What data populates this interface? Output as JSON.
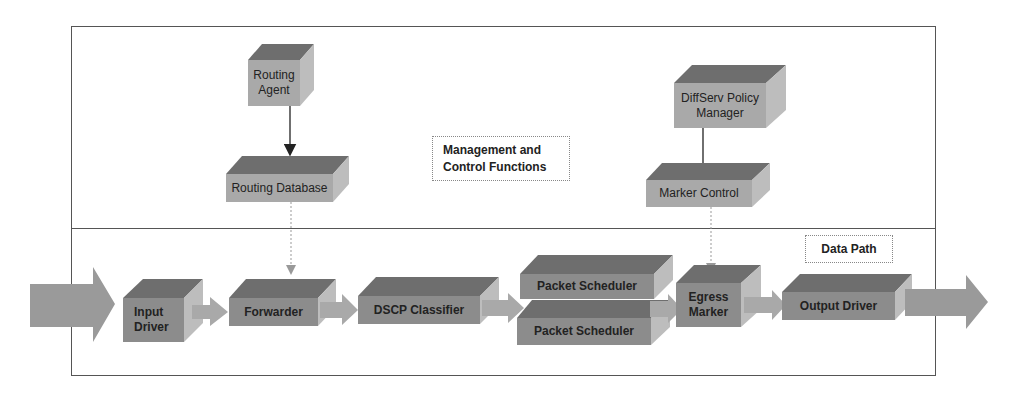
{
  "regions": {
    "management": {
      "label_line1": "Management and",
      "label_line2": "Control Functions"
    },
    "datapath": {
      "label": "Data Path"
    }
  },
  "management_boxes": {
    "routing_agent": {
      "line1": "Routing",
      "line2": "Agent"
    },
    "routing_database": {
      "label": "Routing Database"
    },
    "diffserv_policy_manager": {
      "line1": "DiffServ Policy",
      "line2": "Manager"
    },
    "marker_control": {
      "label": "Marker Control"
    }
  },
  "datapath_boxes": {
    "input_driver": {
      "line1": "Input",
      "line2": "Driver"
    },
    "forwarder": {
      "label": "Forwarder"
    },
    "dscp_classifier": {
      "label": "DSCP Classifier"
    },
    "packet_scheduler_1": {
      "label": "Packet Scheduler"
    },
    "packet_scheduler_2": {
      "label": "Packet Scheduler"
    },
    "egress_marker": {
      "line1": "Egress",
      "line2": "Marker"
    },
    "output_driver": {
      "label": "Output Driver"
    }
  },
  "colors": {
    "front_light": "#a9a9a9",
    "front_dark": "#8c8c8c",
    "top": "#6e6e6e",
    "side": "#bdbdbd",
    "arrow": "#a0a0a0",
    "big_arrow": "#9a9a9a",
    "frame": "#555555"
  }
}
